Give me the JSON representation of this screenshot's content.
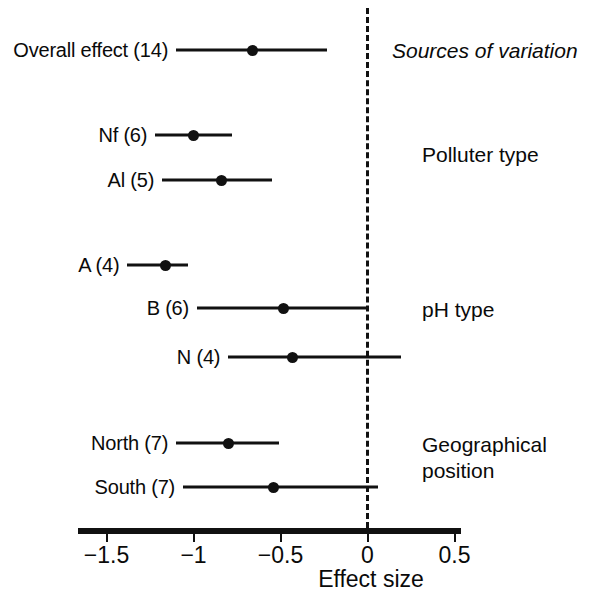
{
  "figure": {
    "axis_title": "Effect size",
    "header_caption": "Sources of variation"
  },
  "chart_data": {
    "type": "scatter",
    "title": "",
    "subtitle": "",
    "xlabel": "Effect size",
    "ylabel": "",
    "xlim": [
      -1.75,
      0.55
    ],
    "xticks": [
      -1.5,
      -1,
      -0.5,
      0,
      0.5
    ],
    "xticklabels": [
      "−1.5",
      "−1",
      "−0.5",
      "0",
      "0.5"
    ],
    "grid": false,
    "legend": "none",
    "reference_line": 0,
    "reference_line_style": "dashed",
    "annotations": [
      "Sources of variation",
      "Polluter type",
      "pH type",
      "Geographical position"
    ],
    "groups": [
      {
        "caption": "Sources of variation",
        "caption_italic": true,
        "rows": [
          {
            "label": "Overall effect (14)",
            "estimate": -0.66,
            "ci_low": -1.1,
            "ci_high": -0.23,
            "n": 14
          }
        ]
      },
      {
        "caption": "Polluter type",
        "caption_italic": false,
        "rows": [
          {
            "label": "Nf (6)",
            "estimate": -1.0,
            "ci_low": -1.22,
            "ci_high": -0.78,
            "n": 6
          },
          {
            "label": "Al (5)",
            "estimate": -0.84,
            "ci_low": -1.18,
            "ci_high": -0.55,
            "n": 5
          }
        ]
      },
      {
        "caption": "pH type",
        "caption_italic": false,
        "rows": [
          {
            "label": "A (4)",
            "estimate": -1.16,
            "ci_low": -1.38,
            "ci_high": -1.03,
            "n": 4
          },
          {
            "label": "B (6)",
            "estimate": -0.48,
            "ci_low": -0.98,
            "ci_high": 0.0,
            "n": 6
          },
          {
            "label": "N (4)",
            "estimate": -0.43,
            "ci_low": -0.8,
            "ci_high": 0.19,
            "n": 4
          }
        ]
      },
      {
        "caption": "Geographical\nposition",
        "caption_italic": false,
        "rows": [
          {
            "label": "North (7)",
            "estimate": -0.8,
            "ci_low": -1.1,
            "ci_high": -0.51,
            "n": 7
          },
          {
            "label": "South (7)",
            "estimate": -0.54,
            "ci_low": -1.06,
            "ci_high": 0.06,
            "n": 7
          }
        ]
      }
    ]
  },
  "rows": [
    {
      "label": "Overall effect (14)",
      "estimate": -0.66,
      "ci_low": -1.1,
      "ci_high": -0.23,
      "y": 50
    },
    {
      "label": "Nf (6)",
      "estimate": -1.0,
      "ci_low": -1.22,
      "ci_high": -0.78,
      "y": 135
    },
    {
      "label": "Al (5)",
      "estimate": -0.84,
      "ci_low": -1.18,
      "ci_high": -0.55,
      "y": 180
    },
    {
      "label": "A (4)",
      "estimate": -1.16,
      "ci_low": -1.38,
      "ci_high": -1.03,
      "y": 265
    },
    {
      "label": "B (6)",
      "estimate": -0.48,
      "ci_low": -0.98,
      "ci_high": 0.0,
      "y": 308
    },
    {
      "label": "N (4)",
      "estimate": -0.43,
      "ci_low": -0.8,
      "ci_high": 0.19,
      "y": 357
    },
    {
      "label": "North (7)",
      "estimate": -0.8,
      "ci_low": -1.1,
      "ci_high": -0.51,
      "y": 443
    },
    {
      "label": "South (7)",
      "estimate": -0.54,
      "ci_low": -1.06,
      "ci_high": 0.06,
      "y": 487
    }
  ],
  "captions": [
    {
      "text": "Sources of variation",
      "italic": true,
      "x": 392,
      "y": 38
    },
    {
      "text": "Polluter type",
      "italic": false,
      "x": 422,
      "y": 142
    },
    {
      "text": "pH type",
      "italic": false,
      "x": 422,
      "y": 297
    },
    {
      "text": "Geographical\nposition",
      "italic": false,
      "x": 422,
      "y": 432
    }
  ],
  "axis": {
    "ticks": [
      {
        "value": -1.5,
        "label": "−1.5"
      },
      {
        "value": -1,
        "label": "−1"
      },
      {
        "value": -0.5,
        "label": "−0.5"
      },
      {
        "value": 0,
        "label": "0"
      },
      {
        "value": 0.5,
        "label": "0.5"
      }
    ],
    "title": "Effect size"
  },
  "colors": {
    "ink": "#111111",
    "background": "#ffffff"
  }
}
